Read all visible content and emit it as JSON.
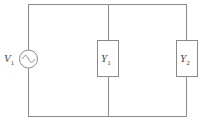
{
  "diagram": {
    "type": "circuit",
    "colors": {
      "wire": "#8a8a8a",
      "text": "#444444",
      "background": "#ffffff"
    },
    "source": {
      "symbol": "V",
      "subscript": "1",
      "kind": "AC voltage source"
    },
    "components": [
      {
        "symbol": "Y",
        "subscript": "1",
        "kind": "admittance"
      },
      {
        "symbol": "Y",
        "subscript": "2",
        "kind": "admittance"
      }
    ]
  }
}
